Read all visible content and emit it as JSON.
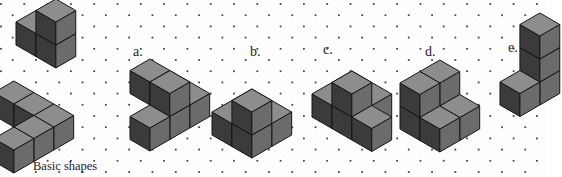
{
  "figure": {
    "background_color": "#fdfdfd",
    "dot_color": "#4a4a4a",
    "width": 547,
    "height": 177
  },
  "cube_colors": {
    "top": "#8d8d8d",
    "left": "#3b3b3b",
    "right": "#6b6b6b",
    "edge": "#151515"
  },
  "caption": {
    "text": "Basic shapes",
    "x": 33,
    "y": 160
  },
  "labels": [
    {
      "text": "a.",
      "x": 133,
      "y": 45
    },
    {
      "text": "b.",
      "x": 250,
      "y": 45
    },
    {
      "text": "c.",
      "x": 323,
      "y": 43
    },
    {
      "text": "d.",
      "x": 425,
      "y": 45
    },
    {
      "text": "e.",
      "x": 508,
      "y": 41
    }
  ],
  "chart_data": {
    "type": "diagram",
    "subtype": "isometric-cube-puzzle",
    "title": "Basic shapes",
    "cube_size": 23,
    "shapes": [
      {
        "id": "basic-shape-upper",
        "name": "basic-shape-upper",
        "origin": {
          "x": 36,
          "y": 22
        },
        "cubes": [
          {
            "x": 0,
            "y": 0,
            "z": 0
          },
          {
            "x": 1,
            "y": 0,
            "z": 0
          },
          {
            "x": 1,
            "y": 0,
            "z": 1
          }
        ]
      },
      {
        "id": "basic-shape-lower",
        "name": "basic-shape-lower",
        "origin": {
          "x": 14,
          "y": 92
        },
        "cubes": [
          {
            "x": 0,
            "y": 0,
            "z": 0
          },
          {
            "x": 1,
            "y": 0,
            "z": 0
          },
          {
            "x": 2,
            "y": 0,
            "z": 0
          },
          {
            "x": 2,
            "y": 1,
            "z": 0
          },
          {
            "x": 2,
            "y": 2,
            "z": 0
          }
        ]
      },
      {
        "id": "shape-a",
        "name": "shape-a",
        "origin": {
          "x": 150,
          "y": 70
        },
        "cubes": [
          {
            "x": 0,
            "y": 0,
            "z": 0
          },
          {
            "x": 1,
            "y": 0,
            "z": 0
          },
          {
            "x": 2,
            "y": 0,
            "z": 0
          },
          {
            "x": 2,
            "y": 1,
            "z": 0
          },
          {
            "x": 2,
            "y": 2,
            "z": 0
          },
          {
            "x": 2,
            "y": 1,
            "z": 1
          }
        ]
      },
      {
        "id": "shape-b",
        "name": "shape-b",
        "origin": {
          "x": 252,
          "y": 100
        },
        "cubes": [
          {
            "x": 0,
            "y": 0,
            "z": 0
          },
          {
            "x": 1,
            "y": 0,
            "z": 0
          },
          {
            "x": 0,
            "y": 1,
            "z": 0
          },
          {
            "x": 1,
            "y": 1,
            "z": 0
          },
          {
            "x": 1,
            "y": 1,
            "z": 1
          }
        ]
      },
      {
        "id": "shape-c",
        "name": "shape-c",
        "origin": {
          "x": 352,
          "y": 82
        },
        "cubes": [
          {
            "x": 0,
            "y": 0,
            "z": 0
          },
          {
            "x": 1,
            "y": 0,
            "z": 0
          },
          {
            "x": 0,
            "y": 1,
            "z": 0
          },
          {
            "x": 1,
            "y": 1,
            "z": 0
          },
          {
            "x": 2,
            "y": 1,
            "z": 0
          },
          {
            "x": 1,
            "y": 1,
            "z": 1
          }
        ]
      },
      {
        "id": "shape-d",
        "name": "shape-d",
        "origin": {
          "x": 440,
          "y": 94
        },
        "cubes": [
          {
            "x": 0,
            "y": 0,
            "z": 0
          },
          {
            "x": 1,
            "y": 0,
            "z": 0
          },
          {
            "x": 0,
            "y": 1,
            "z": 0
          },
          {
            "x": 1,
            "y": 1,
            "z": 0
          },
          {
            "x": 0,
            "y": 0,
            "z": 1
          },
          {
            "x": 0,
            "y": 1,
            "z": 1
          }
        ]
      },
      {
        "id": "shape-e",
        "name": "shape-e",
        "origin": {
          "x": 540,
          "y": 70
        },
        "cubes": [
          {
            "x": 0,
            "y": 0,
            "z": 0
          },
          {
            "x": 0,
            "y": 1,
            "z": 0
          },
          {
            "x": 0,
            "y": 0,
            "z": 1
          },
          {
            "x": 0,
            "y": 0,
            "z": 2
          }
        ]
      }
    ]
  }
}
